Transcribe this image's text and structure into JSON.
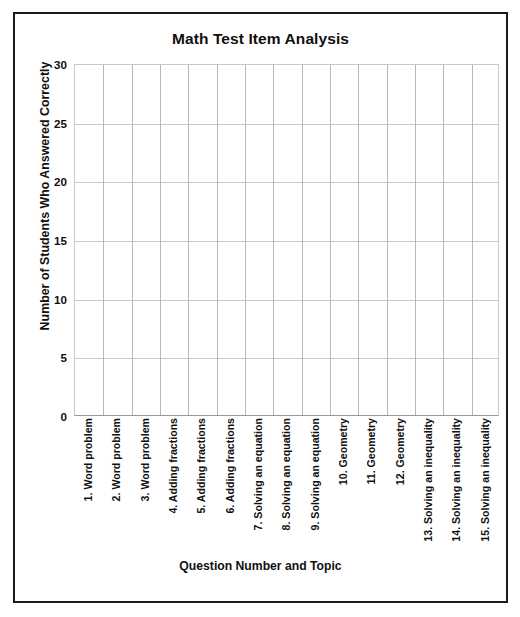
{
  "chart_data": {
    "type": "bar",
    "title": "Math Test Item Analysis",
    "xlabel": "Question Number and Topic",
    "ylabel": "Number of Students Who Answered Correctly",
    "categories": [
      "1. Word problem",
      "2. Word problem",
      "3. Word problem",
      "4. Adding fractions",
      "5. Adding fractions",
      "6. Adding fractions",
      "7. Solving an equation",
      "8. Solving an equation",
      "9. Solving an equation",
      "10. Geometry",
      "11. Geometry",
      "12. Geometry",
      "13. Solving an inequality",
      "14. Solving an inequality",
      "15. Solving an inequality"
    ],
    "values": [
      null,
      null,
      null,
      null,
      null,
      null,
      null,
      null,
      null,
      null,
      null,
      null,
      null,
      null,
      null
    ],
    "ylim": [
      0,
      30
    ],
    "yticks": [
      0,
      5,
      10,
      15,
      20,
      25,
      30
    ],
    "ytick_labels": [
      "0",
      "5",
      "10",
      "15",
      "20",
      "25",
      "30"
    ],
    "grid": true,
    "legend": false,
    "note": "Blank grid template — no bars plotted"
  },
  "colors": {
    "frame": "#1a1a1a",
    "grid": "#c9c9c9",
    "grid_vertical": "#b9b9b9",
    "axis": "#9a9a9a",
    "text": "#101010",
    "background": "#ffffff"
  }
}
